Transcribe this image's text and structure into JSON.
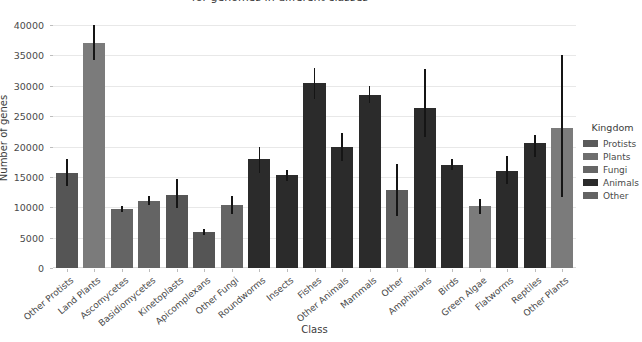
{
  "chart_data": {
    "type": "bar",
    "title": "for genomes in different classes",
    "xlabel": "Class",
    "ylabel": "Number of genes",
    "ylim": [
      0,
      41500
    ],
    "yticks": [
      0,
      5000,
      10000,
      15000,
      20000,
      25000,
      30000,
      35000,
      40000
    ],
    "ytick_labels": [
      "0",
      "5000",
      "10000",
      "15000",
      "20000",
      "25000",
      "30000",
      "35000",
      "40000"
    ],
    "grid": true,
    "legend_position": "right",
    "categories": [
      "Other Protists",
      "Land Plants",
      "Ascomycetes",
      "Basidiomycetes",
      "Kinetoplasts",
      "Apicomplexans",
      "Other Fungi",
      "Roundworms",
      "Insects",
      "Fishes",
      "Other Animals",
      "Mammals",
      "Other",
      "Amphibians",
      "Birds",
      "Green Algae",
      "Flatworms",
      "Reptiles",
      "Other Plants"
    ],
    "values": [
      15600,
      37100,
      9700,
      11100,
      12000,
      5900,
      10400,
      17900,
      15300,
      30500,
      19900,
      28500,
      12800,
      26300,
      17000,
      10200,
      16000,
      20600,
      23000
    ],
    "err_low": [
      13500,
      34300,
      9300,
      10300,
      9900,
      5400,
      8900,
      15700,
      14400,
      27900,
      17600,
      27100,
      8500,
      21600,
      16200,
      8900,
      13900,
      18200,
      11700
    ],
    "err_high": [
      18000,
      40000,
      10200,
      11900,
      14600,
      6400,
      11800,
      19900,
      16200,
      33000,
      22200,
      30000,
      17200,
      32700,
      17900,
      11400,
      18400,
      21900,
      35000
    ],
    "kingdoms": [
      "Protists",
      "Plants",
      "Fungi",
      "Fungi",
      "Protists",
      "Protists",
      "Fungi",
      "Animals",
      "Animals",
      "Animals",
      "Animals",
      "Animals",
      "Other",
      "Animals",
      "Animals",
      "Plants",
      "Animals",
      "Animals",
      "Plants"
    ],
    "legend": {
      "title": "Kingdom",
      "entries": [
        {
          "label": "Protists",
          "color": "#5a5a5a"
        },
        {
          "label": "Plants",
          "color": "#6e6e6e"
        },
        {
          "label": "Fungi",
          "color": "#666666"
        },
        {
          "label": "Animals",
          "color": "#2b2b2b"
        },
        {
          "label": "Other",
          "color": "#636363"
        }
      ]
    },
    "kingdom_colors": {
      "Protists": "#555555",
      "Plants": "#7b7b7b",
      "Fungi": "#646464",
      "Animals": "#2b2b2b",
      "Other": "#5e5e5e"
    },
    "errorbar_color": "#151515",
    "gridline_color": "#e8e8e8"
  }
}
